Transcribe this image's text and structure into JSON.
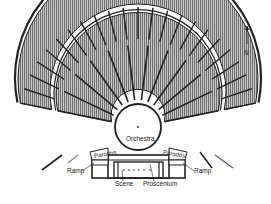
{
  "diagram": {
    "type": "plan",
    "labels": {
      "orchestra": "Orchestra",
      "parodos_left": "Parodos",
      "parodos_right": "Parodos",
      "ramp_left": "Ramp",
      "ramp_right": "Ramp",
      "scene": "Scene",
      "proscenium": "Proscenium",
      "north": "N"
    },
    "colors": {
      "ink": "#222222",
      "seating_fill": "#9a9a9a",
      "background": "#ffffff"
    },
    "geometry": {
      "center": [
        138,
        127
      ],
      "orchestra_radius": 23,
      "inner_cavea_radii": [
        27,
        82
      ],
      "outer_cavea_radii": [
        88,
        120
      ],
      "outer_wall_radius": 123,
      "inner_cavea_wedges": 11,
      "outer_cavea_wedges": 22
    }
  }
}
